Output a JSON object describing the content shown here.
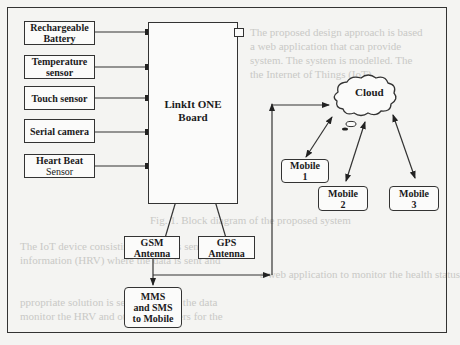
{
  "diagram": {
    "board": {
      "line1": "LinkIt ONE",
      "line2": "Board"
    },
    "inputs": [
      {
        "line1": "Rechargeable",
        "line2": "Battery"
      },
      {
        "line1": "Temperature",
        "line2": "sensor"
      },
      {
        "line1": "Touch sensor",
        "line2": ""
      },
      {
        "line1": "Serial camera",
        "line2": ""
      },
      {
        "line1": "Heart Beat",
        "line2": "Sensor"
      }
    ],
    "antennas": [
      {
        "line1": "GSM",
        "line2": "Antenna"
      },
      {
        "line1": "GPS",
        "line2": "Antenna"
      }
    ],
    "mms": {
      "line1": "MMS",
      "line2": "and SMS",
      "line3": "to Mobile"
    },
    "cloud": {
      "label": "Cloud"
    },
    "mobiles": [
      {
        "line1": "Mobile",
        "line2": "1"
      },
      {
        "line1": "Mobile",
        "line2": "2"
      },
      {
        "line1": "Mobile",
        "line2": "3"
      }
    ],
    "colors": {
      "line": "#333333",
      "background": "#f4f4f2",
      "box_fill": "#fbfbfa"
    }
  },
  "background_text": [
    "The proposed design approach is based",
    "a web application that can provide",
    "system. The system is modelled. The",
    "the Internet of Things (IoT)",
    "Fig. 1. Block diagram of the proposed system",
    "The IoT device consisting of various sensors",
    "information (HRV) where the data is sent and",
    "a web application to monitor the health status",
    "ppropriate solution is sent. Based on the data",
    "monitor the HRV and other parameters for the"
  ]
}
